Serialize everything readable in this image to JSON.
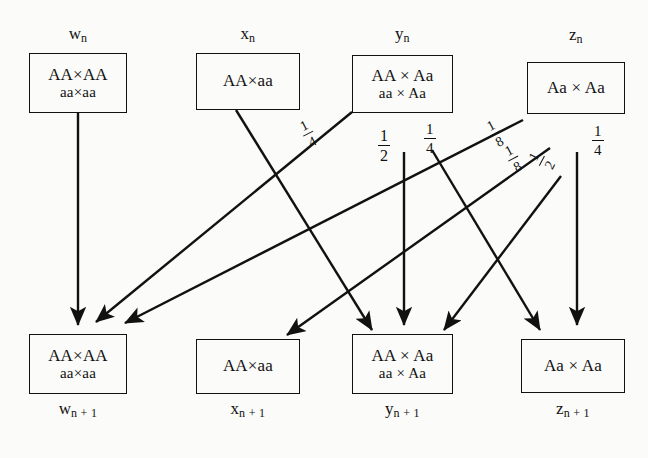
{
  "diagram": {
    "stroke_color": "#111111",
    "background_color": "#fbfbf9"
  },
  "top_boxes": [
    {
      "id": "w-n",
      "label_base": "w",
      "label_sub": "n",
      "lines": [
        "AA×AA",
        "aa×aa"
      ]
    },
    {
      "id": "x-n",
      "label_base": "x",
      "label_sub": "n",
      "lines": [
        "AA×aa"
      ]
    },
    {
      "id": "y-n",
      "label_base": "y",
      "label_sub": "n",
      "lines": [
        "AA × Aa",
        "aa × Aa"
      ]
    },
    {
      "id": "z-n",
      "label_base": "z",
      "label_sub": "n",
      "lines": [
        "Aa × Aa"
      ]
    }
  ],
  "bottom_boxes": [
    {
      "id": "w-n1",
      "label_base": "w",
      "label_sub": "n + 1",
      "lines": [
        "AA×AA",
        "aa×aa"
      ]
    },
    {
      "id": "x-n1",
      "label_base": "x",
      "label_sub": "n + 1",
      "lines": [
        "AA×aa"
      ]
    },
    {
      "id": "y-n1",
      "label_base": "y",
      "label_sub": "n + 1",
      "lines": [
        "AA × Aa",
        "aa × Aa"
      ]
    },
    {
      "id": "z-n1",
      "label_base": "z",
      "label_sub": "n + 1",
      "lines": [
        "Aa × Aa"
      ]
    }
  ],
  "edges": [
    {
      "id": "w-to-w",
      "from": "w-n",
      "to": "w-n1",
      "weight_num": "1",
      "weight_den": "1",
      "weight_shown": false
    },
    {
      "id": "x-to-y",
      "from": "x-n",
      "to": "y-n1",
      "weight_num": "1",
      "weight_den": "1",
      "weight_shown": false
    },
    {
      "id": "y-to-w",
      "from": "y-n",
      "to": "w-n1",
      "weight_num": "1",
      "weight_den": "4",
      "weight_shown": true
    },
    {
      "id": "y-to-y",
      "from": "y-n",
      "to": "y-n1",
      "weight_num": "1",
      "weight_den": "2",
      "weight_shown": true
    },
    {
      "id": "y-to-z",
      "from": "y-n",
      "to": "z-n1",
      "weight_num": "1",
      "weight_den": "4",
      "weight_shown": true
    },
    {
      "id": "z-to-w",
      "from": "z-n",
      "to": "w-n1",
      "weight_num": "1",
      "weight_den": "8",
      "weight_shown": true
    },
    {
      "id": "z-to-x",
      "from": "z-n",
      "to": "x-n1",
      "weight_num": "1",
      "weight_den": "8",
      "weight_shown": true
    },
    {
      "id": "z-to-y",
      "from": "z-n",
      "to": "y-n1",
      "weight_num": "1",
      "weight_den": "2",
      "weight_shown": true
    },
    {
      "id": "z-to-z",
      "from": "z-n",
      "to": "z-n1",
      "weight_num": "1",
      "weight_den": "4",
      "weight_shown": true
    }
  ],
  "fraction_labels": [
    {
      "id": "frac-y-to-w",
      "num": "1",
      "den": "4",
      "rotation_deg": -27
    },
    {
      "id": "frac-y-to-y",
      "num": "1",
      "den": "2",
      "rotation_deg": 0
    },
    {
      "id": "frac-y-to-z",
      "num": "1",
      "den": "4",
      "rotation_deg": 0
    },
    {
      "id": "frac-z-to-w",
      "num": "1",
      "den": "8",
      "rotation_deg": -28
    },
    {
      "id": "frac-z-to-x",
      "num": "1",
      "den": "8",
      "rotation_deg": -28
    },
    {
      "id": "frac-z-to-y",
      "num": "1",
      "den": "2",
      "rotation_deg": -62
    },
    {
      "id": "frac-z-to-z",
      "num": "1",
      "den": "4",
      "rotation_deg": 0
    }
  ]
}
